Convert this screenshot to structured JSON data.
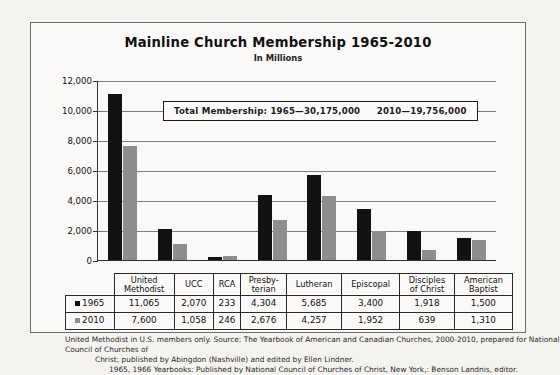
{
  "chart_data": {
    "type": "bar",
    "title": "Mainline Church Membership 1965-2010",
    "subtitle": "In Millions",
    "xlabel": "",
    "ylabel": "",
    "ylim": [
      0,
      12000
    ],
    "ytick_step": 2000,
    "yticks": [
      "12,000",
      "10,000",
      "8,000",
      "6,000",
      "4,000",
      "2,000",
      "0"
    ],
    "grid": true,
    "legend_position": "table-row-labels",
    "categories": [
      "United Methodist",
      "UCC",
      "RCA",
      "Presby-terian",
      "Lutheran",
      "Episcopal",
      "Disciples of Christ",
      "American Baptist"
    ],
    "series": [
      {
        "name": "1965",
        "color": "#121212",
        "values": [
          11065,
          2070,
          233,
          4304,
          5685,
          3400,
          1918,
          1500
        ],
        "labels": [
          "11,065",
          "2,070",
          "233",
          "4,304",
          "5,685",
          "3,400",
          "1,918",
          "1,500"
        ]
      },
      {
        "name": "2010",
        "color": "#8e8e8e",
        "values": [
          7600,
          1058,
          246,
          2676,
          4257,
          1952,
          639,
          1310
        ],
        "labels": [
          "7,600",
          "1,058",
          "246",
          "2,676",
          "4,257",
          "1,952",
          "639",
          "1,310"
        ]
      }
    ],
    "annotations": {
      "total_membership_label": "Total Membership:",
      "total_1965": "1965—30,175,000",
      "total_2010": "2010—19,756,000"
    }
  },
  "category_lines": [
    [
      "United",
      "Methodist"
    ],
    [
      "UCC",
      ""
    ],
    [
      "RCA",
      ""
    ],
    [
      "Presby-",
      "terian"
    ],
    [
      "Lutheran",
      ""
    ],
    [
      "Episcopal",
      ""
    ],
    [
      "Disciples",
      "of Christ"
    ],
    [
      "American",
      "Baptist"
    ]
  ],
  "notes": {
    "line1": "United Methodist in U.S. members only.",
    "line2": "Source: The Yearbook of American and Canadian Churches, 2000-2010, prepared for National Council of Churches of",
    "line3": "Christ; published by Abingdon (Nashville) and edited by Ellen Lindner.",
    "line4": "1965, 1966 Yearbooks: Published by National Council of Churches of Christ, New York,: Benson Landnis, editor."
  }
}
